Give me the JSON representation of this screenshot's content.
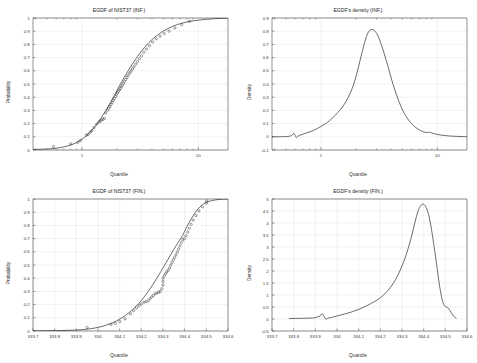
{
  "figure": {
    "background_color": "#ffffff",
    "curve_color": "#1c1c1c",
    "grid_color": "#d9d9d9",
    "axis_color": "#4a4a4a",
    "marker_color": "#242424"
  },
  "panels": {
    "top_left": {
      "title": "EGDF of NIST37 (INF.)",
      "xlabel": "Quantile",
      "ylabel": "Probability",
      "ytick_labels": [
        "0",
        "0.1",
        "0.2",
        "0.3",
        "0.4",
        "0.5",
        "0.6",
        "0.7",
        "0.8",
        "0.9",
        "1"
      ],
      "xtick_labels": [
        "1",
        "10"
      ]
    },
    "top_right": {
      "title": "EGDF's density (INF.)",
      "xlabel": "Quantile",
      "ylabel": "Density",
      "ytick_labels": [
        "-0.1",
        "0",
        "0.1",
        "0.2",
        "0.3",
        "0.4",
        "0.5",
        "0.6",
        "0.7",
        "0.8",
        "0.9"
      ],
      "xtick_labels": [
        "1",
        "10"
      ]
    },
    "bottom_left": {
      "title": "EGDF of NIST37 (FIN.)",
      "xlabel": "Quantile",
      "ylabel": "Probability",
      "ytick_labels": [
        "0",
        "0.1",
        "0.2",
        "0.3",
        "0.4",
        "0.5",
        "0.6",
        "0.7",
        "0.8",
        "0.9",
        "1"
      ],
      "xtick_labels": [
        "333.7",
        "333.8",
        "333.9",
        "334",
        "334.1",
        "334.2",
        "334.3",
        "334.4",
        "334.5",
        "334.6"
      ]
    },
    "bottom_right": {
      "title": "EGDF's density (FIN.)",
      "xlabel": "Quantile",
      "ylabel": "Density",
      "ytick_labels": [
        "-0.5",
        "0",
        "0.5",
        "1",
        "1.5",
        "2",
        "2.5",
        "3",
        "3.5",
        "4",
        "4.5",
        "5"
      ],
      "xtick_labels": [
        "333.7",
        "333.8",
        "333.9",
        "334",
        "334.1",
        "334.2",
        "334.3",
        "334.4",
        "334.5",
        "334.6"
      ]
    }
  },
  "chart_data": [
    {
      "id": "top_left",
      "type": "line",
      "title": "EGDF of NIST37 (INF.)",
      "xlabel": "Quantile",
      "ylabel": "Probability",
      "xscale": "log",
      "xlim": [
        0.38,
        18.0
      ],
      "ylim": [
        0,
        1
      ],
      "grid": true,
      "legend": "none",
      "series": [
        {
          "name": "EGDF fitted curve",
          "style": "line",
          "x": [
            0.38,
            0.45,
            0.55,
            0.65,
            0.75,
            0.85,
            0.95,
            1.05,
            1.15,
            1.3,
            1.45,
            1.6,
            1.75,
            1.9,
            2.05,
            2.2,
            2.4,
            2.6,
            2.8,
            3.0,
            3.3,
            3.6,
            4.0,
            4.5,
            5.0,
            5.6,
            6.3,
            7.0,
            8.0,
            9.0,
            10.5,
            12.0,
            14.0,
            18.0
          ],
          "y": [
            0.004,
            0.006,
            0.01,
            0.018,
            0.03,
            0.046,
            0.068,
            0.095,
            0.126,
            0.18,
            0.238,
            0.298,
            0.357,
            0.414,
            0.468,
            0.518,
            0.575,
            0.625,
            0.669,
            0.708,
            0.757,
            0.796,
            0.836,
            0.873,
            0.9,
            0.924,
            0.944,
            0.957,
            0.97,
            0.978,
            0.986,
            0.991,
            0.995,
            0.999
          ]
        },
        {
          "name": "empirical data points",
          "style": "open-circle-markers",
          "x": [
            0.57,
            0.8,
            0.92,
            0.97,
            1.09,
            1.13,
            1.18,
            1.22,
            1.27,
            1.34,
            1.4,
            1.44,
            1.47,
            1.52,
            1.56,
            1.6,
            1.66,
            1.7,
            1.74,
            1.78,
            1.82,
            1.86,
            1.9,
            1.95,
            1.98,
            2.02,
            2.06,
            2.1,
            2.14,
            2.18,
            2.22,
            2.27,
            2.32,
            2.38,
            2.44,
            2.5,
            2.57,
            2.64,
            2.72,
            2.8,
            2.9,
            3.0,
            3.12,
            3.25,
            3.4,
            3.58,
            3.8,
            4.05,
            4.35,
            4.7,
            5.1,
            5.6,
            6.3,
            7.2,
            8.4
          ],
          "y": [
            0.026,
            0.047,
            0.057,
            0.072,
            0.112,
            0.118,
            0.135,
            0.148,
            0.17,
            0.196,
            0.21,
            0.219,
            0.228,
            0.232,
            0.24,
            0.28,
            0.3,
            0.315,
            0.33,
            0.345,
            0.36,
            0.375,
            0.39,
            0.405,
            0.42,
            0.432,
            0.444,
            0.455,
            0.466,
            0.478,
            0.49,
            0.505,
            0.52,
            0.535,
            0.55,
            0.566,
            0.582,
            0.598,
            0.614,
            0.63,
            0.65,
            0.67,
            0.692,
            0.714,
            0.74,
            0.765,
            0.79,
            0.818,
            0.842,
            0.862,
            0.882,
            0.9,
            0.925,
            0.95,
            0.975
          ]
        }
      ]
    },
    {
      "id": "top_right",
      "type": "line",
      "title": "EGDF's density (INF.)",
      "xlabel": "Quantile",
      "ylabel": "Density",
      "xscale": "log",
      "xlim": [
        0.38,
        18.0
      ],
      "ylim": [
        -0.1,
        0.9
      ],
      "grid": true,
      "legend": "none",
      "series": [
        {
          "name": "density curve",
          "style": "line",
          "x": [
            0.38,
            0.45,
            0.52,
            0.56,
            0.585,
            0.6,
            0.615,
            0.63,
            0.66,
            0.7,
            0.78,
            0.88,
            1.0,
            1.12,
            1.25,
            1.4,
            1.55,
            1.72,
            1.9,
            2.05,
            2.2,
            2.35,
            2.5,
            2.65,
            2.8,
            2.95,
            3.1,
            3.3,
            3.5,
            3.75,
            4.0,
            4.3,
            4.6,
            5.0,
            5.4,
            5.9,
            6.4,
            7.0,
            7.6,
            8.1,
            8.4,
            8.7,
            9.2,
            10.0,
            11.0,
            12.5,
            14.0,
            16.0,
            18.0
          ],
          "y": [
            0.0,
            0.001,
            0.003,
            0.01,
            0.026,
            0.01,
            -0.006,
            0.002,
            0.012,
            0.02,
            0.034,
            0.052,
            0.078,
            0.105,
            0.14,
            0.185,
            0.232,
            0.3,
            0.39,
            0.49,
            0.6,
            0.7,
            0.775,
            0.808,
            0.812,
            0.795,
            0.762,
            0.7,
            0.63,
            0.54,
            0.45,
            0.36,
            0.286,
            0.208,
            0.155,
            0.108,
            0.077,
            0.052,
            0.038,
            0.032,
            0.035,
            0.033,
            0.026,
            0.018,
            0.012,
            0.007,
            0.004,
            0.002,
            0.001
          ]
        }
      ]
    },
    {
      "id": "bottom_left",
      "type": "line",
      "title": "EGDF of NIST37 (FIN.)",
      "xlabel": "Quantile",
      "ylabel": "Probability",
      "xscale": "linear",
      "xlim": [
        333.7,
        334.6
      ],
      "ylim": [
        0,
        1
      ],
      "grid": true,
      "legend": "none",
      "series": [
        {
          "name": "EGDF fitted curve",
          "style": "line",
          "x": [
            333.7,
            333.8,
            333.88,
            333.94,
            333.99,
            334.03,
            334.07,
            334.1,
            334.13,
            334.16,
            334.19,
            334.21,
            334.23,
            334.25,
            334.27,
            334.29,
            334.31,
            334.33,
            334.35,
            334.37,
            334.39,
            334.41,
            334.43,
            334.45,
            334.47,
            334.5,
            334.55,
            334.6
          ],
          "y": [
            0.001,
            0.003,
            0.006,
            0.012,
            0.024,
            0.04,
            0.064,
            0.09,
            0.122,
            0.162,
            0.212,
            0.252,
            0.296,
            0.344,
            0.396,
            0.45,
            0.506,
            0.562,
            0.618,
            0.672,
            0.722,
            0.79,
            0.848,
            0.9,
            0.94,
            0.975,
            0.995,
            1.0
          ]
        },
        {
          "name": "empirical data points",
          "style": "open-circle-markers",
          "x": [
            333.95,
            334.06,
            334.08,
            334.1,
            334.125,
            334.15,
            334.165,
            334.178,
            334.19,
            334.2,
            334.212,
            334.222,
            334.232,
            334.24,
            334.248,
            334.256,
            334.264,
            334.272,
            334.28,
            334.287,
            334.294,
            334.3,
            334.3,
            334.3,
            334.306,
            334.312,
            334.318,
            334.324,
            334.33,
            334.336,
            334.342,
            334.348,
            334.354,
            334.36,
            334.366,
            334.372,
            334.378,
            334.385,
            334.392,
            334.399,
            334.406,
            334.414,
            334.422,
            334.43,
            334.44,
            334.452,
            334.466,
            334.482,
            334.5,
            334.502
          ],
          "y": [
            0.026,
            0.05,
            0.057,
            0.072,
            0.092,
            0.13,
            0.155,
            0.175,
            0.192,
            0.205,
            0.218,
            0.222,
            0.23,
            0.245,
            0.258,
            0.27,
            0.282,
            0.288,
            0.293,
            0.3,
            0.32,
            0.348,
            0.375,
            0.4,
            0.42,
            0.435,
            0.448,
            0.46,
            0.478,
            0.5,
            0.52,
            0.54,
            0.558,
            0.578,
            0.6,
            0.622,
            0.645,
            0.67,
            0.692,
            0.7,
            0.722,
            0.75,
            0.778,
            0.808,
            0.84,
            0.875,
            0.91,
            0.94,
            0.968,
            0.985
          ]
        }
      ]
    },
    {
      "id": "bottom_right",
      "type": "line",
      "title": "EGDF's density (FIN.)",
      "xlabel": "Quantile",
      "ylabel": "Density",
      "xscale": "linear",
      "xlim": [
        333.7,
        334.6
      ],
      "ylim": [
        -0.5,
        5.0
      ],
      "grid": true,
      "legend": "none",
      "series": [
        {
          "name": "density curve",
          "style": "line",
          "x": [
            333.78,
            333.84,
            333.88,
            333.9,
            333.92,
            333.932,
            333.94,
            333.948,
            333.958,
            333.97,
            333.99,
            334.01,
            334.04,
            334.07,
            334.1,
            334.13,
            334.16,
            334.19,
            334.21,
            334.23,
            334.25,
            334.27,
            334.29,
            334.31,
            334.325,
            334.34,
            334.352,
            334.364,
            334.376,
            334.388,
            334.4,
            334.412,
            334.424,
            334.436,
            334.448,
            334.458,
            334.468,
            334.476,
            334.484,
            334.492,
            334.5,
            334.51,
            334.522,
            334.536,
            334.55
          ],
          "y": [
            0.02,
            0.03,
            0.04,
            0.06,
            0.12,
            0.22,
            0.1,
            0.0,
            0.03,
            0.06,
            0.1,
            0.15,
            0.22,
            0.3,
            0.4,
            0.52,
            0.66,
            0.82,
            0.96,
            1.14,
            1.36,
            1.64,
            2.0,
            2.44,
            2.84,
            3.3,
            3.74,
            4.18,
            4.54,
            4.74,
            4.78,
            4.64,
            4.3,
            3.74,
            3.02,
            2.4,
            1.72,
            1.24,
            0.86,
            0.62,
            0.52,
            0.48,
            0.34,
            0.14,
            0.04
          ]
        }
      ]
    }
  ]
}
